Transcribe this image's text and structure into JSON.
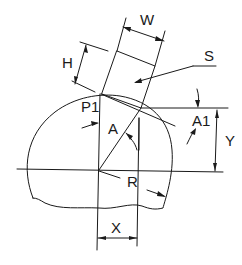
{
  "diagram": {
    "labels": {
      "W": "W",
      "H": "H",
      "S": "S",
      "P1": "P1",
      "A": "A",
      "A1": "A1",
      "Y": "Y",
      "R": "R",
      "X": "X"
    },
    "colors": {
      "line": "#1a1a1a",
      "background": "#ffffff"
    }
  }
}
